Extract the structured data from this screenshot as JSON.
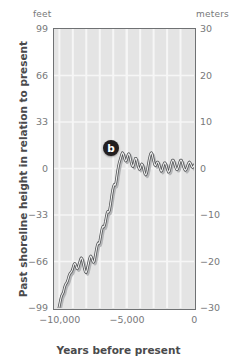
{
  "units": {
    "left_label": "feet",
    "right_label": "meters"
  },
  "axis_titles": {
    "y": "Past shoreline height in relation to present",
    "x": "Years before present"
  },
  "annotations": [
    {
      "id": "b",
      "label": "b",
      "x": -6200,
      "y_meters": 4.5
    }
  ],
  "colors": {
    "plot_background": "#e4e4e4",
    "gridline": "#f6f6f6",
    "frame": "#6f7173",
    "curve": "#4d4f51",
    "curve_shadow": "#b4b5b7",
    "tick_text": "#77787a",
    "title_text": "#4a4a4c",
    "marker_fill": "#231f20",
    "marker_text": "#ffffff"
  },
  "chart_data": {
    "type": "line",
    "title": "",
    "subtitle": "",
    "xlabel": "Years before present",
    "ylabel": "Past shoreline height in relation to present",
    "xlim": [
      -10400,
      0
    ],
    "ylim_meters": [
      -30,
      30
    ],
    "ylim_feet": [
      -99,
      99
    ],
    "grid": true,
    "legend_position": "none",
    "secondary_axis": {
      "side": "left",
      "unit": "feet",
      "ticks": [
        99,
        66,
        33,
        0,
        -33,
        -66,
        -99
      ],
      "tick_labels": [
        "99",
        "66",
        "33",
        "0",
        "−33",
        "−66",
        "−99"
      ]
    },
    "primary_axis": {
      "side": "right",
      "unit": "meters",
      "ticks": [
        30,
        20,
        10,
        0,
        -10,
        -20,
        -30
      ],
      "tick_labels": [
        "30",
        "20",
        "10",
        "0",
        "−10",
        "−20",
        "−30"
      ]
    },
    "xticks": [
      -10000,
      -5000,
      0
    ],
    "xtick_labels": [
      "−10,000",
      "−5,000",
      "0"
    ],
    "xgridlines": [
      -9000,
      -8000,
      -7000,
      -6000,
      -5000,
      -4000,
      -3000,
      -2000,
      -1000
    ],
    "series": [
      {
        "name": "Past shoreline height",
        "unit": "meters",
        "x": [
          -10400,
          -10330,
          -10260,
          -10190,
          -10120,
          -10050,
          -9980,
          -9910,
          -9840,
          -9770,
          -9700,
          -9640,
          -9580,
          -9520,
          -9460,
          -9400,
          -9340,
          -9280,
          -9220,
          -9160,
          -9100,
          -9040,
          -8980,
          -8920,
          -8860,
          -8800,
          -8740,
          -8680,
          -8620,
          -8560,
          -8500,
          -8440,
          -8380,
          -8320,
          -8260,
          -8200,
          -8140,
          -8080,
          -8020,
          -7960,
          -7900,
          -7840,
          -7780,
          -7720,
          -7660,
          -7600,
          -7540,
          -7480,
          -7420,
          -7360,
          -7300,
          -7240,
          -7180,
          -7120,
          -7060,
          -7000,
          -6940,
          -6880,
          -6820,
          -6760,
          -6700,
          -6640,
          -6580,
          -6520,
          -6460,
          -6400,
          -6340,
          -6280,
          -6220,
          -6160,
          -6100,
          -6040,
          -5980,
          -5920,
          -5860,
          -5800,
          -5740,
          -5680,
          -5620,
          -5560,
          -5500,
          -5440,
          -5380,
          -5320,
          -5260,
          -5200,
          -5140,
          -5080,
          -5020,
          -4960,
          -4900,
          -4840,
          -4780,
          -4720,
          -4660,
          -4600,
          -4540,
          -4480,
          -4420,
          -4360,
          -4300,
          -4240,
          -4180,
          -4120,
          -4060,
          -4000,
          -3940,
          -3880,
          -3820,
          -3760,
          -3700,
          -3640,
          -3580,
          -3520,
          -3460,
          -3400,
          -3340,
          -3280,
          -3220,
          -3160,
          -3100,
          -3040,
          -2980,
          -2920,
          -2860,
          -2800,
          -2740,
          -2680,
          -2620,
          -2560,
          -2500,
          -2440,
          -2380,
          -2320,
          -2260,
          -2200,
          -2140,
          -2080,
          -2020,
          -1960,
          -1900,
          -1840,
          -1780,
          -1720,
          -1660,
          -1600,
          -1540,
          -1480,
          -1420,
          -1360,
          -1300,
          -1240,
          -1180,
          -1120,
          -1060,
          -1000,
          -940,
          -880,
          -820,
          -760,
          -700,
          -640,
          -580,
          -520,
          -460,
          -400,
          -340,
          -280,
          -220,
          -160,
          -100,
          -40,
          0
        ],
        "y": [
          -35.0,
          -33.6,
          -32.2,
          -31.4,
          -31.0,
          -30.2,
          -29.2,
          -28.2,
          -27.4,
          -27.0,
          -26.6,
          -25.8,
          -25.2,
          -24.8,
          -24.6,
          -24.2,
          -23.6,
          -23.0,
          -22.6,
          -22.4,
          -22.2,
          -21.8,
          -21.2,
          -20.6,
          -20.4,
          -20.6,
          -21.2,
          -21.6,
          -21.4,
          -20.8,
          -20.2,
          -19.6,
          -19.2,
          -19.4,
          -20.0,
          -20.8,
          -21.6,
          -22.2,
          -22.4,
          -22.0,
          -21.2,
          -20.4,
          -19.6,
          -19.0,
          -18.8,
          -19.2,
          -19.8,
          -20.2,
          -20.0,
          -19.2,
          -18.2,
          -17.2,
          -16.4,
          -16.0,
          -16.2,
          -15.6,
          -14.6,
          -13.6,
          -12.8,
          -12.4,
          -12.6,
          -12.2,
          -11.4,
          -10.4,
          -9.6,
          -9.2,
          -9.4,
          -9.0,
          -8.0,
          -6.8,
          -5.6,
          -4.6,
          -3.8,
          -3.4,
          -3.6,
          -3.0,
          -1.8,
          -0.6,
          0.4,
          1.2,
          1.8,
          2.4,
          3.0,
          3.4,
          3.2,
          2.6,
          2.0,
          1.6,
          1.8,
          2.4,
          3.0,
          3.2,
          2.8,
          2.0,
          1.2,
          0.6,
          0.4,
          0.8,
          1.6,
          2.2,
          2.2,
          1.6,
          0.8,
          0.2,
          -0.2,
          0.0,
          0.6,
          1.0,
          0.8,
          0.2,
          -0.6,
          -1.2,
          -1.4,
          -1.0,
          -0.2,
          0.8,
          1.8,
          2.6,
          3.2,
          3.4,
          3.0,
          2.2,
          1.4,
          0.8,
          0.6,
          1.0,
          1.4,
          1.4,
          1.0,
          0.4,
          -0.2,
          -0.6,
          -0.4,
          0.2,
          0.8,
          1.2,
          1.2,
          0.8,
          0.2,
          -0.4,
          -0.8,
          -0.6,
          0.0,
          0.8,
          1.4,
          1.8,
          1.8,
          1.4,
          0.8,
          0.2,
          -0.2,
          -0.2,
          0.2,
          0.8,
          1.4,
          1.8,
          1.8,
          1.4,
          0.8,
          0.2,
          -0.2,
          -0.4,
          -0.2,
          0.2,
          0.8,
          1.2,
          1.4,
          1.2,
          0.8,
          0.4,
          0.2,
          0.4,
          0.8
        ]
      }
    ]
  }
}
